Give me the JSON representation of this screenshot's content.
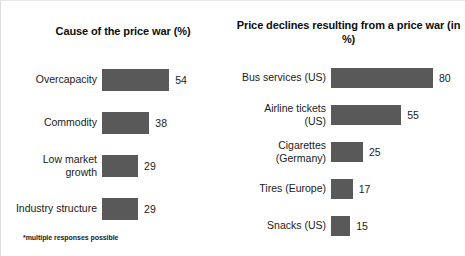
{
  "footnote": "*multiple responses possible",
  "colors": {
    "bar_fill": "#595959",
    "background": "#ffffff",
    "text": "#1a1a1a"
  },
  "chart_data": [
    {
      "type": "bar",
      "orientation": "horizontal",
      "title": "Cause of the price war (%)",
      "xlabel": "",
      "ylabel": "",
      "xlim": [
        0,
        60
      ],
      "grid": false,
      "legend": null,
      "categories": [
        "Overcapacity",
        "Commodity",
        "Low market\ngrowth",
        "Industry structure"
      ],
      "values": [
        54,
        38,
        29,
        29
      ],
      "value_labels": [
        "54",
        "38",
        "29",
        "29"
      ],
      "annotations": [
        "*multiple responses possible"
      ]
    },
    {
      "type": "bar",
      "orientation": "horizontal",
      "title": "Price declines resulting\nfrom a price war (in %)",
      "xlabel": "",
      "ylabel": "",
      "xlim": [
        0,
        85
      ],
      "grid": false,
      "legend": null,
      "categories": [
        "Bus services (US)",
        "Airline tickets (US)",
        "Cigarettes (Germany)",
        "Tires (Europe)",
        "Snacks (US)"
      ],
      "values": [
        80,
        55,
        25,
        17,
        15
      ],
      "value_labels": [
        "80",
        "55",
        "25",
        "17",
        "15"
      ],
      "annotations": []
    }
  ]
}
